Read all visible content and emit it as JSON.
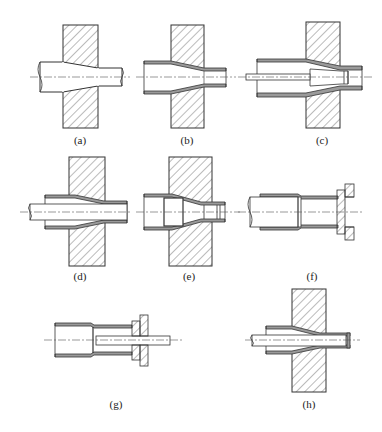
{
  "figure": {
    "panels": [
      {
        "id": "a",
        "label": "(a)"
      },
      {
        "id": "b",
        "label": "(b)"
      },
      {
        "id": "c",
        "label": "(c)"
      },
      {
        "id": "d",
        "label": "(d)"
      },
      {
        "id": "e",
        "label": "(e)"
      },
      {
        "id": "f",
        "label": "(f)"
      },
      {
        "id": "g",
        "label": "(g)"
      },
      {
        "id": "h",
        "label": "(h)"
      }
    ]
  },
  "colors": {
    "line": "#333333",
    "wall": "#9a9a9a",
    "hatch": "#555555",
    "background": "#ffffff"
  }
}
